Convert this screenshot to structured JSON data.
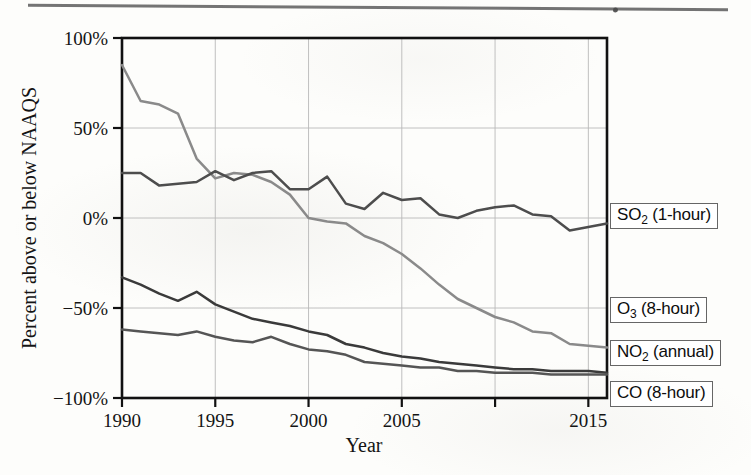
{
  "figure": {
    "page_rule": "horizontal-rule",
    "background": "#fdfdfb"
  },
  "axes": {
    "ylabel": "Percent above or below NAAQS",
    "xlabel": "Year",
    "yticks": [
      "100%",
      "50%",
      "0%",
      "−50%",
      "−100%"
    ],
    "ytick_values": [
      100,
      50,
      0,
      -50,
      -100
    ],
    "xticks": [
      "1990",
      "1995",
      "2000",
      "2005",
      "",
      "2015"
    ],
    "xtick_values": [
      1990,
      1995,
      2000,
      2005,
      2010,
      2015
    ],
    "xlim": [
      1990,
      2016
    ],
    "ylim": [
      -100,
      100
    ],
    "grid": true,
    "grid_color": "#b9b9b9",
    "frame_color": "#111111"
  },
  "legend": {
    "position": "right-outside",
    "entries": [
      {
        "id": "so2",
        "label_html": "SO<sub>2</sub> (1-hour)",
        "label": "SO2 (1-hour)",
        "color": "#4d4d4d"
      },
      {
        "id": "o3",
        "label_html": "O<sub>3</sub> (8-hour)",
        "label": "O3 (8-hour)",
        "color": "#8a8a8a"
      },
      {
        "id": "no2",
        "label_html": "NO<sub>2</sub> (annual)",
        "label": "NO2 (annual)",
        "color": "#3a3a3a"
      },
      {
        "id": "co",
        "label_html": "CO (8-hour)",
        "label": "CO (8-hour)",
        "color": "#555555"
      }
    ]
  },
  "chart_data": {
    "type": "line",
    "title": "",
    "xlabel": "Year",
    "ylabel": "Percent above or below NAAQS",
    "xlim": [
      1990,
      2016
    ],
    "ylim": [
      -100,
      100
    ],
    "grid": true,
    "legend_position": "right-outside",
    "x": [
      1990,
      1991,
      1992,
      1993,
      1994,
      1995,
      1996,
      1997,
      1998,
      1999,
      2000,
      2001,
      2002,
      2003,
      2004,
      2005,
      2006,
      2007,
      2008,
      2009,
      2010,
      2011,
      2012,
      2013,
      2014,
      2015,
      2016
    ],
    "series": [
      {
        "name": "O3 (8-hour)",
        "color": "#8a8a8a",
        "values": [
          85,
          65,
          63,
          58,
          33,
          22,
          25,
          24,
          20,
          13,
          0,
          -2,
          -3,
          -10,
          -14,
          -20,
          -28,
          -37,
          -45,
          -50,
          -55,
          -58,
          -63,
          -64,
          -70,
          -71,
          -72
        ]
      },
      {
        "name": "SO2 (1-hour)",
        "color": "#4d4d4d",
        "values": [
          25,
          25,
          18,
          19,
          20,
          26,
          21,
          25,
          26,
          16,
          16,
          23,
          8,
          5,
          14,
          10,
          11,
          2,
          0,
          4,
          6,
          7,
          2,
          1,
          -7,
          -5,
          -3
        ]
      },
      {
        "name": "NO2 (annual)",
        "color": "#3a3a3a",
        "values": [
          -33,
          -37,
          -42,
          -46,
          -41,
          -48,
          -52,
          -56,
          -58,
          -60,
          -63,
          -65,
          -70,
          -72,
          -75,
          -77,
          -78,
          -80,
          -81,
          -82,
          -83,
          -84,
          -84,
          -85,
          -85,
          -85,
          -86
        ]
      },
      {
        "name": "CO (8-hour)",
        "color": "#555555",
        "values": [
          -62,
          -63,
          -64,
          -65,
          -63,
          -66,
          -68,
          -69,
          -66,
          -70,
          -73,
          -74,
          -76,
          -80,
          -81,
          -82,
          -83,
          -83,
          -85,
          -85,
          -86,
          -86,
          -86,
          -87,
          -87,
          -87,
          -87
        ]
      }
    ]
  }
}
